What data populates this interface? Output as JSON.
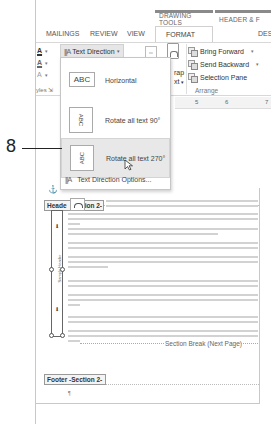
{
  "contextual_tabs": {
    "drawing_tools": "DRAWING TOOLS",
    "header_footer": "HEADER & F"
  },
  "ribbon": {
    "tabs": [
      {
        "label": "MAILINGS",
        "active": false
      },
      {
        "label": "REVIEW",
        "active": false
      },
      {
        "label": "VIEW",
        "active": false
      },
      {
        "label": "FORMAT",
        "active": true
      },
      {
        "label": "DES",
        "active": false
      }
    ],
    "left_tools": [
      {
        "icon": "font-color-icon",
        "glyph": "A"
      },
      {
        "icon": "highlight-icon",
        "glyph": "A"
      },
      {
        "icon": "text-effects-icon",
        "glyph": "A"
      }
    ],
    "styles_group_label": "yles",
    "text_direction_label": "Text Direction",
    "wrap_label_1": "rap",
    "wrap_label_2": "xt",
    "arrange": {
      "bring_forward": "Bring Forward",
      "send_backward": "Send Backward",
      "selection_pane": "Selection Pane",
      "group_label": "Arrange"
    }
  },
  "ruler": {
    "ticks": [
      "5",
      "6",
      "7"
    ]
  },
  "text_direction_menu": {
    "items": [
      {
        "label": "Horizontal",
        "thumb": "ABC",
        "rotation": "none"
      },
      {
        "label": "Rotate all text 90°",
        "thumb": "ABC",
        "rotation": "90"
      },
      {
        "label": "Rotate all text 270°",
        "thumb": "ABC",
        "rotation": "270",
        "hover": true
      }
    ],
    "options_label": "Text Direction Options..."
  },
  "callout": {
    "number": "8"
  },
  "document": {
    "header_label": "Header -Section 2-",
    "header_visible_left": "Heade",
    "header_visible_right": "tion 2-",
    "textbox_vertical_label": "Sample Header",
    "section_break": "Section Break (Next Page)",
    "footer_label": "Footer -Section 2-",
    "paragraph_mark": "¶"
  }
}
